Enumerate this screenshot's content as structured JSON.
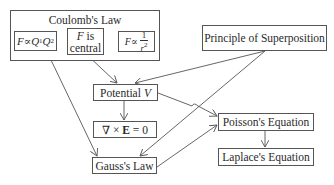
{
  "diagram": {
    "nodes": {
      "coulomb": {
        "title": "Coulomb's Law",
        "sub": {
          "proportional_charges": {
            "F": "F",
            "rel": "∝",
            "Q": "Q",
            "s1": "1",
            "Q2": "Q",
            "s2": "2"
          },
          "central": {
            "F": "F",
            "rest": " is",
            "line2": "central"
          },
          "inverse_square": {
            "F": "F",
            "rel": "∝",
            "num": "1",
            "den": "r",
            "exp": "2"
          }
        }
      },
      "superposition": {
        "label": "Principle of Superposition"
      },
      "potential": {
        "label": "Potential ",
        "var": "V"
      },
      "curl": {
        "label_pre": "∇ × ",
        "var": "E",
        "label_post": " = 0"
      },
      "gauss": {
        "label": "Gauss's Law"
      },
      "poisson": {
        "label": "Poisson's Equation"
      },
      "laplace": {
        "label": "Laplace's Equation"
      }
    },
    "edges": [
      {
        "from": "F is central",
        "to": "Potential V"
      },
      {
        "from": "Principle of Superposition",
        "to": "Potential V"
      },
      {
        "from": "Coulomb's Law",
        "to": "Gauss's Law"
      },
      {
        "from": "Potential V",
        "to": "∇ × E = 0"
      },
      {
        "from": "Potential V",
        "to": "Poisson's Equation"
      },
      {
        "from": "Principle of Superposition",
        "to": "Gauss's Law"
      },
      {
        "from": "Gauss's Law",
        "to": "Poisson's Equation"
      },
      {
        "from": "Poisson's Equation",
        "to": "Laplace's Equation"
      }
    ],
    "colors": {
      "line": "#555555",
      "text": "#2a2a2a",
      "background": "#ffffff"
    }
  }
}
